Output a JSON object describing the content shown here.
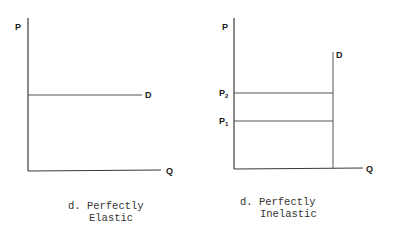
{
  "panels": [
    {
      "id": "perfectly-elastic",
      "y_axis_label": "P",
      "x_axis_label": "Q",
      "curve_label": "D",
      "caption_line1": "d. Perfectly",
      "caption_line2": "Elastic"
    },
    {
      "id": "perfectly-inelastic",
      "y_axis_label": "P",
      "x_axis_label": "Q",
      "curve_label": "D",
      "price_labels": [
        {
          "main": "P",
          "sub": "2"
        },
        {
          "main": "P",
          "sub": "1"
        }
      ],
      "caption_line1": "d. Perfectly",
      "caption_line2": "Inelastic"
    }
  ],
  "colors": {
    "line": "#3a3a3a",
    "text": "#1a1a1a"
  }
}
